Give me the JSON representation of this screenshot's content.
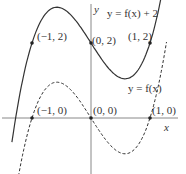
{
  "chart_data": {
    "type": "line",
    "title": "",
    "xlabel": "x",
    "ylabel": "y",
    "series": [
      {
        "name": "y = f(x) + 2",
        "style": "solid",
        "formula": "x^3 - x + 2",
        "points": [
          {
            "x": -1,
            "y": 2,
            "label": "(−1, 2)"
          },
          {
            "x": 0,
            "y": 2,
            "label": "(0, 2)"
          },
          {
            "x": 1,
            "y": 2,
            "label": "(1, 2)"
          }
        ]
      },
      {
        "name": "y = f(x)",
        "style": "dashed",
        "formula": "x^3 - x",
        "points": [
          {
            "x": -1,
            "y": 0,
            "label": "(−1, 0)"
          },
          {
            "x": 0,
            "y": 0,
            "label": "(0, 0)"
          },
          {
            "x": 1,
            "y": 0,
            "label": "(1, 0)"
          }
        ]
      }
    ],
    "grid": false
  },
  "labels": {
    "axis_x": "x",
    "axis_y": "y",
    "solid_curve": "y = f(x) + 2",
    "dashed_curve": "y = f(x)",
    "p1": "(−1, 2)",
    "p2": "(0, 2)",
    "p3": "(1, 2)",
    "p4": "(−1, 0)",
    "p5": "(0, 0)",
    "p6": "(1, 0)"
  },
  "colors": {
    "axis": "#777777",
    "curve": "#333333"
  }
}
